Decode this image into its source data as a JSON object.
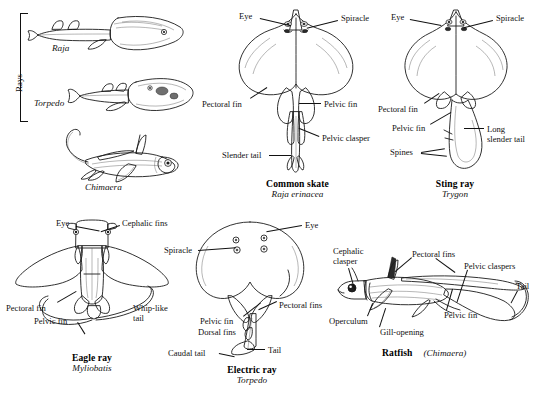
{
  "plate": {
    "title": "Rays and Chimaeras comparative plate",
    "group_label": "Rays"
  },
  "specimens": [
    {
      "id": "raja-lateral",
      "common_name": "",
      "scientific_name": "Raja",
      "view": "lateral",
      "labels": []
    },
    {
      "id": "torpedo-lateral",
      "common_name": "",
      "scientific_name": "Torpedo",
      "view": "lateral",
      "labels": []
    },
    {
      "id": "chimaera-lateral",
      "common_name": "",
      "scientific_name": "Chimaera",
      "view": "lateral",
      "labels": []
    },
    {
      "id": "common-skate",
      "common_name": "Common skate",
      "scientific_name": "Raja erinacea",
      "view": "ventral",
      "labels": [
        {
          "key": "eye",
          "text": "Eye"
        },
        {
          "key": "spiracle",
          "text": "Spiracle"
        },
        {
          "key": "pectoral-fin",
          "text": "Pectoral fin"
        },
        {
          "key": "pelvic-fin",
          "text": "Pelvic fin"
        },
        {
          "key": "pelvic-clasper",
          "text": "Pelvic clasper"
        },
        {
          "key": "slender-tail",
          "text": "Slender tail"
        }
      ]
    },
    {
      "id": "sting-ray",
      "common_name": "Sting ray",
      "scientific_name": "Trygon",
      "view": "ventral",
      "labels": [
        {
          "key": "eye",
          "text": "Eye"
        },
        {
          "key": "spiracle",
          "text": "Spiracle"
        },
        {
          "key": "pectoral-fin",
          "text": "Pectoral fin"
        },
        {
          "key": "pelvic-fin",
          "text": "Pelvic fin"
        },
        {
          "key": "spines",
          "text": "Spines"
        },
        {
          "key": "long-slender-tail-1",
          "text": "Long"
        },
        {
          "key": "long-slender-tail-2",
          "text": "slender tail"
        }
      ]
    },
    {
      "id": "eagle-ray",
      "common_name": "Eagle ray",
      "scientific_name": "Myliobatis",
      "view": "dorsal",
      "labels": [
        {
          "key": "eye",
          "text": "Eye"
        },
        {
          "key": "cephalic-fins",
          "text": "Cephalic fins"
        },
        {
          "key": "pectoral-fin",
          "text": "Pectoral fin"
        },
        {
          "key": "pelvic-fin",
          "text": "Pelvic fin"
        },
        {
          "key": "whip-like-tail-1",
          "text": "Whip-like"
        },
        {
          "key": "whip-like-tail-2",
          "text": "tail"
        }
      ]
    },
    {
      "id": "electric-ray",
      "common_name": "Electric ray",
      "scientific_name": "Torpedo",
      "view": "dorsal",
      "labels": [
        {
          "key": "eye",
          "text": "Eye"
        },
        {
          "key": "spiracle",
          "text": "Spiracle"
        },
        {
          "key": "pectoral-fins",
          "text": "Pectoral fins"
        },
        {
          "key": "pelvic-fin",
          "text": "Pelvic fin"
        },
        {
          "key": "dorsal-fins",
          "text": "Dorsal fins"
        },
        {
          "key": "caudal-tail",
          "text": "Caudal  tail"
        },
        {
          "key": "tail",
          "text": "Tail"
        }
      ]
    },
    {
      "id": "ratfish",
      "common_name": "Ratfish",
      "scientific_name": "(Chimaera)",
      "view": "lateral",
      "labels": [
        {
          "key": "cephalic-clasper-1",
          "text": "Cephalic"
        },
        {
          "key": "cephalic-clasper-2",
          "text": "clasper"
        },
        {
          "key": "pectoral-fins",
          "text": "Pectoral fins"
        },
        {
          "key": "pelvic-claspers",
          "text": "Pelvic claspers"
        },
        {
          "key": "tail",
          "text": "Tail"
        },
        {
          "key": "operculum",
          "text": "Operculum"
        },
        {
          "key": "gill-opening",
          "text": "Gill-opening"
        },
        {
          "key": "pelvic-fin",
          "text": "Pelvic fin"
        }
      ]
    }
  ],
  "colors": {
    "ink": "#1b1b1b",
    "paper": "#ffffff",
    "shade_mid": "#8d8d8d",
    "shade_dark": "#2a2a2a"
  }
}
